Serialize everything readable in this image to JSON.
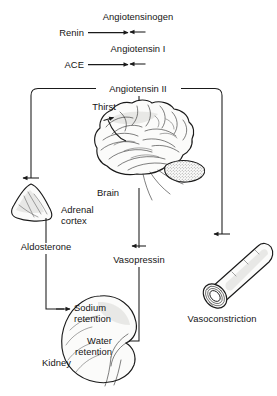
{
  "diagram": {
    "colors": {
      "ink": "#1a1a1a",
      "text": "#141414",
      "paper": "#ffffff",
      "organ_fill": "#fbfbfa",
      "shade": "#d9d9d6"
    },
    "nodes": {
      "angiotensinogen": "Angiotensinogen",
      "renin": "Renin",
      "angiotensin_i": "Angiotensin I",
      "ace": "ACE",
      "angiotensin_ii": "Angiotensin II",
      "thirst": "Thirst",
      "brain": "Brain",
      "adrenal_cortex_line1": "Adrenal",
      "adrenal_cortex_line2": "cortex",
      "aldosterone": "Aldosterone",
      "vasopressin": "Vasopressin",
      "vasoconstriction": "Vasoconstriction",
      "sodium_retention_line1": "Sodium",
      "sodium_retention_line2": "retention",
      "water_retention_line1": "Water",
      "water_retention_line2": "retention",
      "kidney": "Kidney"
    },
    "illustrations": {
      "brain": "brain-illustration",
      "adrenal_gland": "adrenal-gland-illustration",
      "blood_vessel": "blood-vessel-illustration",
      "kidney": "kidney-illustration"
    },
    "edges": [
      {
        "from": "Angiotensinogen",
        "to": "Angiotensin I",
        "catalyst": "Renin"
      },
      {
        "from": "Angiotensin I",
        "to": "Angiotensin II",
        "catalyst": "ACE"
      },
      {
        "from": "Angiotensin II",
        "to": "Adrenal cortex"
      },
      {
        "from": "Angiotensin II",
        "to": "Brain"
      },
      {
        "from": "Angiotensin II",
        "to": "Vasoconstriction"
      },
      {
        "from": "Brain",
        "to": "Thirst"
      },
      {
        "from": "Brain",
        "to": "Vasopressin"
      },
      {
        "from": "Adrenal cortex",
        "to": "Sodium retention",
        "mediator": "Aldosterone"
      },
      {
        "from": "Vasopressin",
        "to": "Water retention"
      }
    ]
  }
}
